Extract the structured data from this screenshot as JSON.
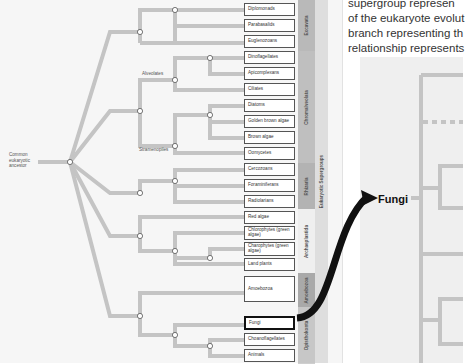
{
  "intro": {
    "lines": [
      "supergroup represen",
      "of the eukaryote evolut",
      "branch representing th",
      "relationship represents"
    ]
  },
  "tree": {
    "root_label": "Common eukaryotic ancestor",
    "clade_labels": {
      "alveolates": "Alveolates",
      "stramenopiles": "Stramenopiles"
    },
    "taxa": [
      {
        "name": "Diplomonads",
        "top": 3
      },
      {
        "name": "Parabasalids",
        "top": 19
      },
      {
        "name": "Euglenozoans",
        "top": 35
      },
      {
        "name": "Dinoflagellates",
        "top": 51
      },
      {
        "name": "Apicomplexans",
        "top": 67
      },
      {
        "name": "Ciliates",
        "top": 83
      },
      {
        "name": "Diatoms",
        "top": 99
      },
      {
        "name": "Golden brown algae",
        "top": 115
      },
      {
        "name": "Brown algae",
        "top": 131
      },
      {
        "name": "Oomycetes",
        "top": 147
      },
      {
        "name": "Cercozoans",
        "top": 163
      },
      {
        "name": "Foraminiferans",
        "top": 179
      },
      {
        "name": "Radiolarians",
        "top": 195
      },
      {
        "name": "Red algae",
        "top": 211
      },
      {
        "name": "Chlorophytes (green algae)",
        "top": 226
      },
      {
        "name": "Charophytes (green algae)",
        "top": 242
      },
      {
        "name": "Land plants",
        "top": 258
      },
      {
        "name": "Amoebozoa",
        "top": 285
      },
      {
        "name": "Fungi",
        "top": 318,
        "highlight": true
      },
      {
        "name": "Choanoflagellates",
        "top": 333
      },
      {
        "name": "Animals",
        "top": 349
      }
    ],
    "groups": [
      {
        "name": "Excavata",
        "top": 0,
        "height": 51,
        "color": "#b9b9b9"
      },
      {
        "name": "Chromalveolata",
        "top": 51,
        "height": 112,
        "color": "#bfbfbf"
      },
      {
        "name": "Rhizaria",
        "top": 163,
        "height": 46,
        "color": "#b3b3b3"
      },
      {
        "name": "Archaeplastida",
        "top": 209,
        "height": 64,
        "color": "#efefef"
      },
      {
        "name": "Amoebozoa",
        "top": 273,
        "height": 34,
        "color": "#a9a9a9"
      },
      {
        "name": "Opisthokonta",
        "top": 307,
        "height": 56,
        "color": "#c7c7c7"
      }
    ],
    "supergroup_label": "Eukaryotic Supergroups"
  },
  "zoom_panel": {
    "label": "Fungi"
  },
  "colors": {
    "branch": "#c4c4c4",
    "node_fill": "#ffffff",
    "node_stroke": "#555555",
    "arrow": "#111111"
  }
}
